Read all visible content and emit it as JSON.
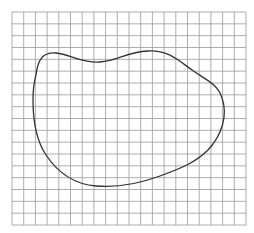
{
  "diagram": {
    "type": "grid-with-closed-curve",
    "background_color": "#ffffff",
    "grid": {
      "x0": 12,
      "y0": 12,
      "x1": 246,
      "y1": 225,
      "cell_size": 11.7,
      "columns": 20,
      "rows": 18,
      "line_color": "#9a9a9a"
    },
    "curve": {
      "stroke_color": "#333333",
      "stroke_width": 1.3,
      "path": "M 36 75 C 38 58, 44 52, 56 53 C 70 54, 80 63, 100 62 C 118 61, 126 52, 148 51 C 168 50, 178 60, 192 70 C 206 80, 218 84, 222 98 C 228 115, 222 135, 208 150 C 196 162, 182 168, 160 176 C 138 184, 118 188, 96 186 C 72 184, 56 170, 46 155 C 36 140, 33 118, 33 100 C 33 90, 34 82, 36 75 Z"
    }
  }
}
